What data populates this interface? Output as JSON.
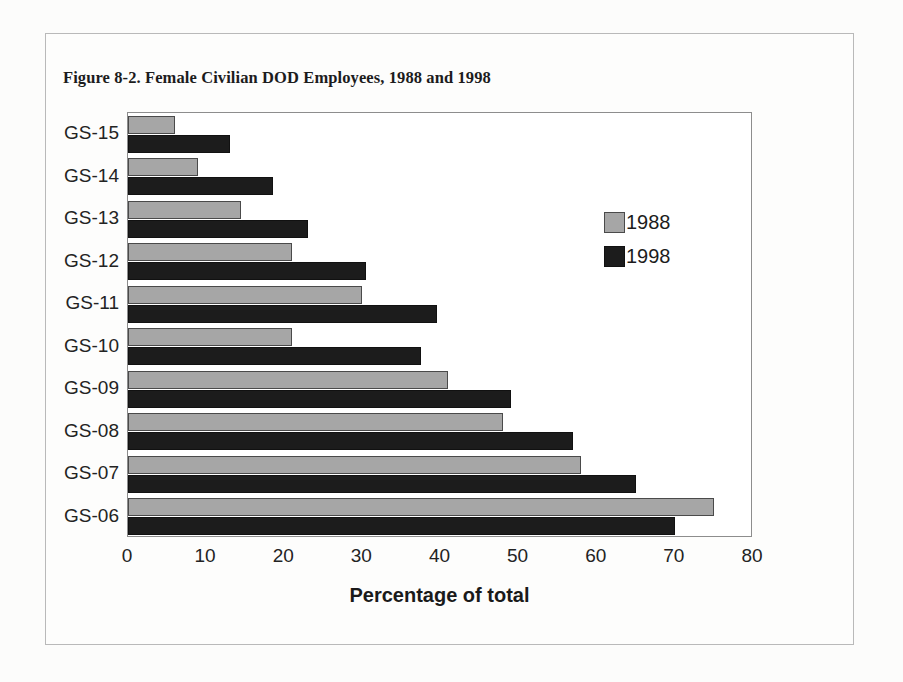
{
  "figure": {
    "title": "Figure 8-2. Female Civilian DOD Employees, 1988 and 1998"
  },
  "legend": {
    "items": [
      {
        "label": "1988",
        "color": "#a6a6a6"
      },
      {
        "label": "1998",
        "color": "#1c1c1c"
      }
    ]
  },
  "chart_data": {
    "type": "bar",
    "orientation": "horizontal",
    "title": "Figure 8-2. Female Civilian DOD Employees, 1988 and 1998",
    "xlabel": "Percentage of total",
    "ylabel": "",
    "xlim": [
      0,
      80
    ],
    "xticks": [
      0,
      10,
      20,
      30,
      40,
      50,
      60,
      70,
      80
    ],
    "grid": false,
    "legend_position": "inside-right",
    "categories": [
      "GS-15",
      "GS-14",
      "GS-13",
      "GS-12",
      "GS-11",
      "GS-10",
      "GS-09",
      "GS-08",
      "GS-07",
      "GS-06"
    ],
    "series": [
      {
        "name": "1988",
        "color": "#a6a6a6",
        "values": [
          6,
          9,
          14.5,
          21,
          30,
          21,
          41,
          48,
          58,
          75
        ]
      },
      {
        "name": "1998",
        "color": "#1c1c1c",
        "values": [
          13,
          18.5,
          23,
          30.5,
          39.5,
          37.5,
          49,
          57,
          65,
          70
        ]
      }
    ]
  }
}
